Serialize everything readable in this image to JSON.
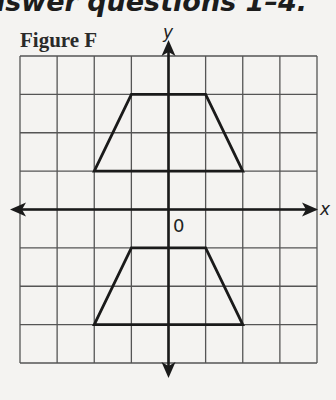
{
  "heading": {
    "text": "nswer questions 1–4."
  },
  "figure": {
    "label": "Figure F",
    "x_axis_label": "x",
    "y_axis_label": "y",
    "origin_label": "0"
  },
  "chart_data": {
    "type": "coordinate-grid",
    "title": "Figure F",
    "xlabel": "x",
    "ylabel": "y",
    "xlim": [
      -4,
      4
    ],
    "ylim": [
      -4,
      4
    ],
    "grid": true,
    "grid_step": 1,
    "shapes": [
      {
        "name": "upper-trapezoid",
        "type": "polygon",
        "vertices": [
          [
            -1,
            3
          ],
          [
            1,
            3
          ],
          [
            2,
            1
          ],
          [
            -2,
            1
          ]
        ]
      },
      {
        "name": "lower-trapezoid",
        "type": "polygon",
        "vertices": [
          [
            -1,
            -1
          ],
          [
            1,
            -1
          ],
          [
            2,
            -3
          ],
          [
            -2,
            -3
          ]
        ]
      }
    ]
  },
  "colors": {
    "grid": "#555555",
    "axis": "#1a1a1a",
    "shape": "#1a1a1a",
    "background": "#f4f3f1"
  }
}
